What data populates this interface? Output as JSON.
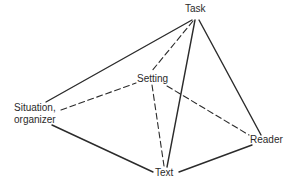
{
  "diagram": {
    "colors": {
      "line": "#2b2b2b",
      "text": "#2a2a2a",
      "background": "#ffffff"
    },
    "nodes": {
      "task": {
        "label": "Task"
      },
      "setting": {
        "label": "Setting"
      },
      "situation": {
        "label": "Situation,\norganizer"
      },
      "reader": {
        "label": "Reader"
      },
      "text": {
        "label": "Text"
      }
    },
    "edges": [
      {
        "from": "Situation, organizer",
        "to": "Task",
        "style": "solid"
      },
      {
        "from": "Situation, organizer",
        "to": "Setting",
        "style": "dashed"
      },
      {
        "from": "Situation, organizer",
        "to": "Text",
        "style": "solid"
      },
      {
        "from": "Task",
        "to": "Setting",
        "style": "dashed"
      },
      {
        "from": "Task",
        "to": "Text",
        "style": "solid"
      },
      {
        "from": "Task",
        "to": "Reader",
        "style": "solid"
      },
      {
        "from": "Setting",
        "to": "Text",
        "style": "dashed"
      },
      {
        "from": "Setting",
        "to": "Reader",
        "style": "dashed"
      },
      {
        "from": "Text",
        "to": "Reader",
        "style": "solid"
      }
    ]
  }
}
